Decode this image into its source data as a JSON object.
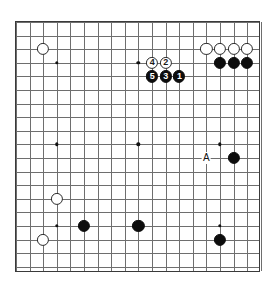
{
  "board": {
    "name": "go-board",
    "size": 19,
    "grid_origin_x": 15,
    "grid_origin_y": 21,
    "grid_spacing": 13.6,
    "stone_radius": 6.1,
    "line_color": "#6e6e6e",
    "border_color": "#3a3a3a",
    "background_color": "#ffffff",
    "black_color": "#0d0d0d",
    "white_color": "#ffffff",
    "star_points": [
      {
        "col": 3,
        "row": 3
      },
      {
        "col": 9,
        "row": 3
      },
      {
        "col": 15,
        "row": 3
      },
      {
        "col": 3,
        "row": 9
      },
      {
        "col": 9,
        "row": 9
      },
      {
        "col": 15,
        "row": 9
      },
      {
        "col": 3,
        "row": 15
      },
      {
        "col": 9,
        "row": 15
      },
      {
        "col": 15,
        "row": 15
      }
    ],
    "stones": [
      {
        "col": 2,
        "row": 2,
        "color": "white",
        "label": ""
      },
      {
        "col": 14,
        "row": 2,
        "color": "white",
        "label": ""
      },
      {
        "col": 15,
        "row": 2,
        "color": "white",
        "label": ""
      },
      {
        "col": 16,
        "row": 2,
        "color": "white",
        "label": ""
      },
      {
        "col": 17,
        "row": 2,
        "color": "white",
        "label": ""
      },
      {
        "col": 15,
        "row": 3,
        "color": "black",
        "label": ""
      },
      {
        "col": 16,
        "row": 3,
        "color": "black",
        "label": ""
      },
      {
        "col": 17,
        "row": 3,
        "color": "black",
        "label": ""
      },
      {
        "col": 10,
        "row": 3,
        "color": "white",
        "label": "4"
      },
      {
        "col": 11,
        "row": 3,
        "color": "white",
        "label": "2"
      },
      {
        "col": 10,
        "row": 4,
        "color": "black",
        "label": "5"
      },
      {
        "col": 11,
        "row": 4,
        "color": "black",
        "label": "3"
      },
      {
        "col": 12,
        "row": 4,
        "color": "black",
        "label": "1"
      },
      {
        "col": 16,
        "row": 10,
        "color": "black",
        "label": ""
      },
      {
        "col": 3,
        "row": 13,
        "color": "white",
        "label": ""
      },
      {
        "col": 5,
        "row": 15,
        "color": "black",
        "label": ""
      },
      {
        "col": 9,
        "row": 15,
        "color": "black",
        "label": ""
      },
      {
        "col": 2,
        "row": 16,
        "color": "white",
        "label": ""
      },
      {
        "col": 15,
        "row": 16,
        "color": "black",
        "label": ""
      }
    ],
    "markers": [
      {
        "col": 14,
        "row": 10,
        "text": "A",
        "type": "letter-marker"
      }
    ]
  }
}
